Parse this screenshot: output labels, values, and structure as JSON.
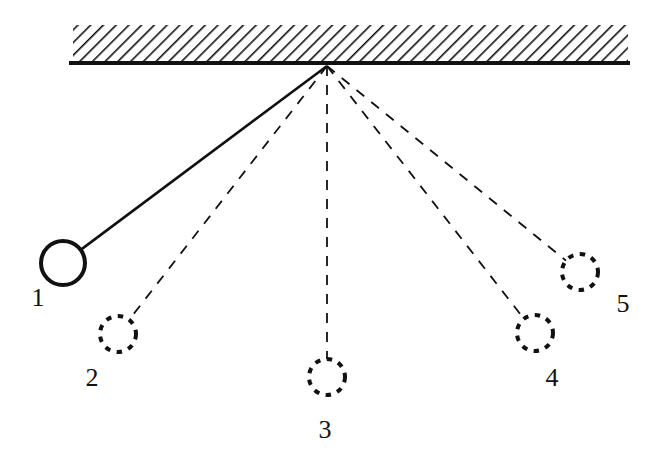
{
  "diagram": {
    "title": "",
    "type": "pendulum-positions",
    "ceiling": {
      "x1": 73,
      "x2": 628,
      "hatch_top": 25,
      "bar_y": 63
    },
    "pivot": {
      "x": 327,
      "y": 66
    },
    "positions": [
      {
        "id": "1",
        "label": "1",
        "style": "solid",
        "cx": 63,
        "cy": 263,
        "r": 22,
        "lx": 38,
        "ly": 306
      },
      {
        "id": "2",
        "label": "2",
        "style": "dashed",
        "cx": 118,
        "cy": 334,
        "r": 18,
        "lx": 92,
        "ly": 386
      },
      {
        "id": "3",
        "label": "3",
        "style": "dashed",
        "cx": 327,
        "cy": 377,
        "r": 18,
        "lx": 325,
        "ly": 438
      },
      {
        "id": "4",
        "label": "4",
        "style": "dashed",
        "cx": 535,
        "cy": 333,
        "r": 18,
        "lx": 552,
        "ly": 386
      },
      {
        "id": "5",
        "label": "5",
        "style": "dashed",
        "cx": 580,
        "cy": 272,
        "r": 18,
        "lx": 623,
        "ly": 312
      }
    ],
    "colors": {
      "ink": "#111111",
      "background": "#ffffff"
    }
  }
}
